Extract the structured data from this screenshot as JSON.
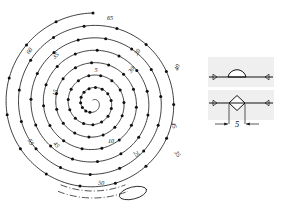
{
  "figure": {
    "ink_color": "#1d1d1d",
    "background": "#ffffff"
  },
  "chart_data": {
    "type": "scatter",
    "title": "",
    "xlabel": "",
    "ylabel": "",
    "center": {
      "x": 93,
      "y": 103
    },
    "spiral": {
      "turns": 7,
      "start_radius": 3,
      "end_radius": 90,
      "marker_count": 96,
      "marker_radius": 1.5
    },
    "zone_labels": [
      {
        "text": "5",
        "x": 96,
        "y": 72,
        "rotation": 0
      },
      {
        "text": "10",
        "x": 111,
        "y": 143,
        "rotation": 0
      },
      {
        "text": "15",
        "x": 57,
        "y": 93,
        "rotation": -78
      },
      {
        "text": "20",
        "x": 139,
        "y": 53,
        "rotation": -60
      },
      {
        "text": "25",
        "x": 135,
        "y": 155,
        "rotation": 58
      },
      {
        "text": "30",
        "x": 133,
        "y": 71,
        "rotation": -52
      },
      {
        "text": "35",
        "x": 57,
        "y": 57,
        "rotation": -44
      },
      {
        "text": "40",
        "x": 179,
        "y": 68,
        "rotation": -70
      },
      {
        "text": "45",
        "x": 55,
        "y": 146,
        "rotation": 48
      },
      {
        "text": "50",
        "x": 101,
        "y": 185,
        "rotation": 4
      },
      {
        "text": "55",
        "x": 29,
        "y": 143,
        "rotation": 62
      },
      {
        "text": "60",
        "x": 31,
        "y": 52,
        "rotation": -56
      },
      {
        "text": "65",
        "x": 110,
        "y": 20,
        "rotation": 0
      },
      {
        "text": "45",
        "x": 172,
        "y": 126,
        "rotation": 72
      },
      {
        "text": "35",
        "x": 176,
        "y": 155,
        "rotation": 56
      }
    ],
    "bottom_dashdot_arcs": 2,
    "bottom_detail_oval": {
      "cx": 133,
      "cy": 193,
      "rx": 14,
      "ry": 6
    }
  },
  "inset": {
    "name": "cross-section-detail",
    "panels": [
      {
        "id": "dome",
        "label": "",
        "shape": "semicircular boss on centerline in hatched material"
      },
      {
        "id": "diamond",
        "label": "",
        "shape": "rhombic boss on centerline in hatched material"
      }
    ],
    "dimension": {
      "value": "5",
      "arrows": "outward"
    },
    "hatch_angle_deg": 45
  }
}
